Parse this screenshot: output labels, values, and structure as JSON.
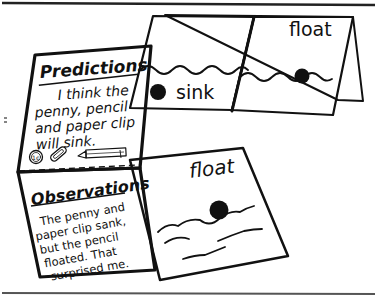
{
  "illustration": {
    "description": "Folded science journal booklet showing predictions and observations about sink/float",
    "colors": {
      "ink": "#111111",
      "paper": "#ffffff",
      "rule": "#222222"
    },
    "back_card": {
      "left_panel_label": "sink",
      "right_panel_label": "float"
    },
    "front_page": {
      "predictions": {
        "heading": "Predictions",
        "lines": [
          "I think the",
          "penny, pencil",
          "and paper clip",
          "will sink."
        ]
      },
      "items_icons": [
        "penny-icon",
        "paper-clip-icon",
        "pencil-icon"
      ],
      "penny_value": "1¢",
      "observations": {
        "heading": "Observations",
        "lines": [
          "The penny and",
          "paper clip sank,",
          "but the pencil",
          "floated. That",
          "surprised me."
        ]
      }
    },
    "bottom_card": {
      "label": "float"
    }
  }
}
